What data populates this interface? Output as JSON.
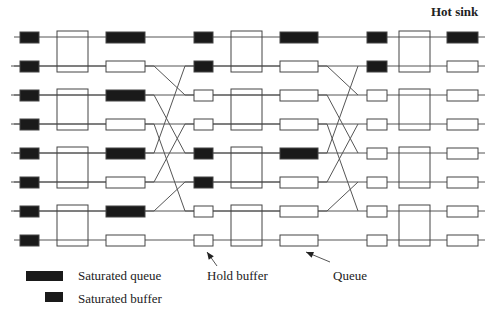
{
  "title": "Hot sink",
  "legend": {
    "saturated_queue": "Saturated queue",
    "saturated_buffer": "Saturated buffer"
  },
  "annotations": {
    "hold_buffer": "Hold buffer",
    "queue": "Queue"
  },
  "colors": {
    "line": "#555555",
    "fill": "#1a1a1a",
    "stroke": "#444444"
  },
  "rows_y": [
    37,
    66,
    95,
    124,
    153,
    182,
    211,
    240
  ],
  "columns": [
    {
      "buffer_x": [
        20,
        39
      ],
      "switch_x": [
        57,
        88
      ],
      "queue_x": [
        106,
        145
      ],
      "buffer_sat": [
        true,
        true,
        true,
        true,
        true,
        true,
        true,
        true
      ],
      "queue_sat": [
        true,
        false,
        true,
        false,
        true,
        false,
        true,
        false
      ]
    },
    {
      "buffer_x": [
        194,
        213
      ],
      "switch_x": [
        231,
        262
      ],
      "queue_x": [
        280,
        318
      ],
      "buffer_sat": [
        true,
        true,
        false,
        false,
        true,
        true,
        false,
        false
      ],
      "queue_sat": [
        true,
        false,
        false,
        false,
        true,
        false,
        false,
        false
      ]
    },
    {
      "buffer_x": [
        367,
        387
      ],
      "switch_x": [
        399,
        430
      ],
      "queue_x": [
        447,
        478
      ],
      "buffer_sat": [
        true,
        true,
        false,
        false,
        false,
        false,
        false,
        false
      ],
      "queue_sat": [
        true,
        false,
        false,
        false,
        false,
        false,
        false,
        false
      ]
    }
  ],
  "shuffle": [
    [
      1,
      2
    ],
    [
      2,
      4
    ],
    [
      3,
      6
    ],
    [
      4,
      1
    ],
    [
      5,
      3
    ],
    [
      6,
      5
    ]
  ],
  "shuffle_x": [
    [
      145,
      194
    ],
    [
      318,
      367
    ]
  ]
}
